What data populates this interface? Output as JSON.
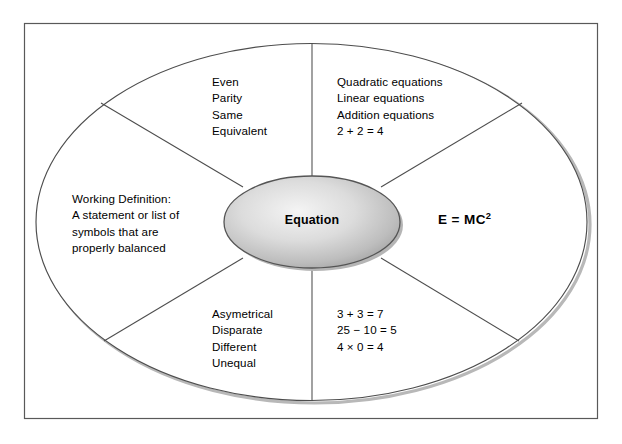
{
  "diagram": {
    "type": "frayer-model-concept-circle",
    "center_concept": "Equation",
    "formula": {
      "base": "E = MC",
      "exponent": "2"
    },
    "quadrants": {
      "top_left": {
        "name": "synonyms",
        "lines": [
          "Even",
          "Parity",
          "Same",
          "Equivalent"
        ]
      },
      "top_right": {
        "name": "examples",
        "lines": [
          "Quadratic equations",
          "Linear equations",
          "Addition equations",
          "2 + 2 = 4"
        ]
      },
      "left": {
        "name": "working-definition",
        "lines": [
          "Working Definition:",
          "A statement or list of",
          "symbols that are",
          "properly balanced"
        ]
      },
      "bottom_left": {
        "name": "antonyms",
        "lines": [
          "Asymetrical",
          "Disparate",
          "Different",
          "Unequal"
        ]
      },
      "bottom_right": {
        "name": "non-examples",
        "lines": [
          "3 + 3 = 7",
          "25 − 10 = 5",
          "4 × 0 = 4"
        ]
      }
    }
  },
  "colors": {
    "line": "#4d4d4d",
    "frame": "#595959",
    "text": "#000000",
    "ellipse_fill_light": "#f2f2f2",
    "ellipse_fill_dark": "#9a9a9a",
    "shadow": "#b3b3b3",
    "page_background": "#ffffff"
  }
}
